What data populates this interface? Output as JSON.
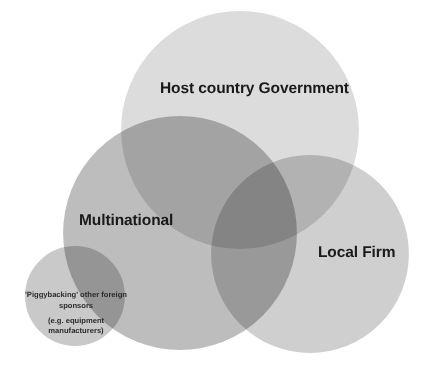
{
  "diagram": {
    "type": "venn",
    "title": "",
    "background_color": "#ffffff",
    "stroke_color": "#ffffff",
    "sets": [
      {
        "id": "host-country-government",
        "label": "Host country Government",
        "fill_color": "#dcdcdc",
        "cx": 240,
        "cy": 130,
        "r": 120
      },
      {
        "id": "multinational",
        "label": "Multinational",
        "fill_color": "#b4b4b4",
        "cx": 180,
        "cy": 233,
        "r": 118
      },
      {
        "id": "local-firm",
        "label": "Local Firm",
        "fill_color": "#cbcbcb",
        "cx": 310,
        "cy": 254,
        "r": 100
      },
      {
        "id": "piggybacking",
        "label": "'Piggybacking' other foreign sponsors",
        "sublabel": "(e.g. equipment manufacturers)",
        "fill_color": "#b4b4b4",
        "cx": 75,
        "cy": 296,
        "r": 51
      }
    ]
  },
  "labels": {
    "host": "Host country Government",
    "multinational": "Multinational",
    "local_firm": "Local Firm",
    "piggyback_line1": "'Piggybacking' other foreign sponsors",
    "piggyback_line2": "(e.g. equipment manufacturers)"
  }
}
